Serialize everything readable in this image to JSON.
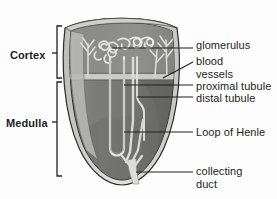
{
  "figure": {
    "background_color": "#fdfdfd",
    "ink_color": "#231f20"
  },
  "region_labels": [
    {
      "id": "cortex",
      "text": "Cortex"
    },
    {
      "id": "medulla",
      "text": "Medulla"
    }
  ],
  "callouts": [
    {
      "id": "glomerulus",
      "text": "glomerulus"
    },
    {
      "id": "blood_vessels",
      "line1": "blood",
      "line2": "vessels"
    },
    {
      "id": "proximal_tubule",
      "text": "proximal tubule"
    },
    {
      "id": "distal_tubule",
      "text": "distal tubule"
    },
    {
      "id": "loop_of_henle",
      "text": "Loop of Henle"
    },
    {
      "id": "collecting_duct",
      "line1": "collecting",
      "line2": "duct"
    }
  ],
  "colors": {
    "capsule_light": "#d8d8d6",
    "cortex_gray": "#8f8f8f",
    "medulla_gray": "#7a7a7a",
    "medulla_dark": "#6a6a6a",
    "boundary_band": "#cfcfcd",
    "tubule_light": "#dcdcda",
    "outline": "#2b2b2b"
  }
}
